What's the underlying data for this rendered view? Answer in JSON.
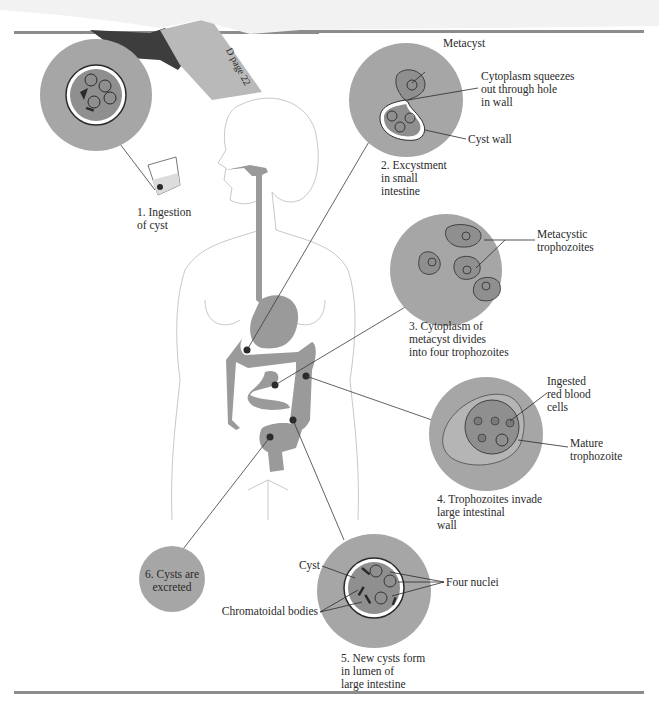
{
  "figure": {
    "title_tab": "D page 22",
    "colors": {
      "disc": "#a6a6a6",
      "organ": "#9a9a9a",
      "outline": "#c8c8c8",
      "rule": "#8c8c8c",
      "ink": "#2a2a2a",
      "cyst_inner": "#8f8f8f"
    },
    "steps": [
      {
        "id": 1,
        "label": "1. Ingestion\nof cyst"
      },
      {
        "id": 2,
        "label": "2. Excystment\n    in small\n    intestine"
      },
      {
        "id": 3,
        "label": "3. Cytoplasm of\n    metacyst divides\n    into four trophozoites"
      },
      {
        "id": 4,
        "label": "4. Trophozoites invade\n    large intestinal\n    wall"
      },
      {
        "id": 5,
        "label": "5. New cysts form\n    in lumen of\n    large intestine"
      },
      {
        "id": 6,
        "label": "6. Cysts are\nexcreted"
      }
    ],
    "callouts": {
      "metacyst": "Metacyst",
      "cytoplasm_squeezes": "Cytoplasm squeezes\nout through hole\nin wall",
      "cyst_wall": "Cyst wall",
      "metacystic_trophozoites": "Metacystic\ntrophozoites",
      "ingested_rbc": "Ingested\nred blood\ncells",
      "mature_trophozoite": "Mature\ntrophozoite",
      "cyst": "Cyst",
      "four_nuclei": "Four nuclei",
      "chromatoidal_bodies": "Chromatoidal bodies"
    }
  }
}
